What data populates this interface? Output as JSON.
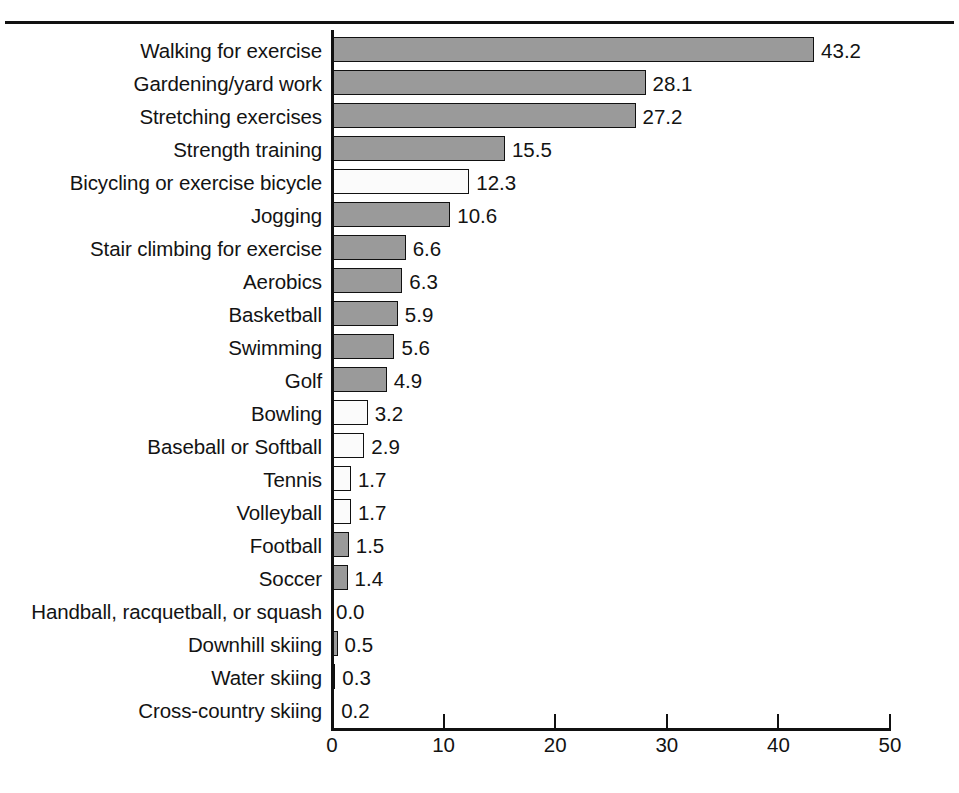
{
  "figure": {
    "has_top_rule": true,
    "background_color": "#ffffff",
    "bar_fill_gray": "#9a9a9a",
    "bar_fill_white": "#fbfbfb",
    "bar_border_color": "#111111"
  },
  "axis": {
    "x_ticks": [
      "0",
      "10",
      "20",
      "30",
      "40",
      "50"
    ],
    "x_tick_values": [
      0,
      10,
      20,
      30,
      40,
      50
    ],
    "x_min": 0,
    "x_max": 50,
    "x_pixels_per_unit": 11.16,
    "x_origin_px": 332
  },
  "bottom_caption": "",
  "chart_data": {
    "type": "bar",
    "orientation": "horizontal",
    "title": "",
    "subtitle": "",
    "xlabel": "",
    "ylabel": "",
    "xlim": [
      0,
      50
    ],
    "grid": false,
    "legend": "none",
    "categories": [
      "Walking for exercise",
      "Gardening/yard work",
      "Stretching exercises",
      "Strength training",
      "Bicycling or exercise bicycle",
      "Jogging",
      "Stair climbing for exercise",
      "Aerobics",
      "Basketball",
      "Swimming",
      "Golf",
      "Bowling",
      "Baseball or Softball",
      "Tennis",
      "Volleyball",
      "Football",
      "Soccer",
      "Handball, racquetball, or squash",
      "Downhill skiing",
      "Water skiing",
      "Cross-country skiing"
    ],
    "values": [
      43.2,
      28.1,
      27.2,
      15.5,
      12.3,
      10.6,
      6.6,
      6.3,
      5.9,
      5.6,
      4.9,
      3.2,
      2.9,
      1.7,
      1.7,
      1.5,
      1.4,
      0.0,
      0.5,
      0.3,
      0.2
    ],
    "value_labels": [
      "43.2",
      "28.1",
      "27.2",
      "15.5",
      "12.3",
      "10.6",
      "6.6",
      "6.3",
      "5.9",
      "5.6",
      "4.9",
      "3.2",
      "2.9",
      "1.7",
      "1.7",
      "1.5",
      "1.4",
      "0.0",
      "0.5",
      "0.3",
      "0.2"
    ],
    "bar_styles": [
      "filled",
      "filled",
      "filled",
      "filled",
      "hollow",
      "filled",
      "filled",
      "filled",
      "filled",
      "filled",
      "filled",
      "hollow",
      "hollow",
      "hollow",
      "hollow",
      "filled",
      "filled",
      "zero",
      "filled",
      "filled",
      "filled"
    ]
  }
}
